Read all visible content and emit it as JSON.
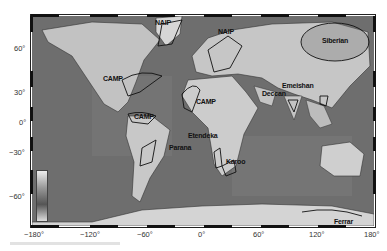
{
  "map": {
    "title": "World map of Large Igneous Provinces",
    "projection": "equirectangular",
    "x_axis": {
      "ticks": [
        "−180°",
        "−120°",
        "−60°",
        "0°",
        "60°",
        "120°",
        "180°"
      ]
    },
    "y_axis": {
      "ticks": [
        "60°",
        "30°",
        "0°",
        "−30°",
        "−60°"
      ]
    },
    "colors": {
      "ocean": "#6e6e6e",
      "land": "#c8c8c8",
      "outline": "#111111",
      "frame": "#222222"
    },
    "labels": [
      {
        "id": "naip-1",
        "text": "NAIP"
      },
      {
        "id": "naip-2",
        "text": "NAIP"
      },
      {
        "id": "siberian",
        "text": "Siberian"
      },
      {
        "id": "camp-na",
        "text": "CAMP"
      },
      {
        "id": "camp-af",
        "text": "CAMP"
      },
      {
        "id": "camp-sa",
        "text": "CAMP"
      },
      {
        "id": "emeishan",
        "text": "Emeishan"
      },
      {
        "id": "deccan",
        "text": "Deccan"
      },
      {
        "id": "etendeka",
        "text": "Etendeka"
      },
      {
        "id": "parana",
        "text": "Parana"
      },
      {
        "id": "karoo",
        "text": "Karoo"
      },
      {
        "id": "ferrar",
        "text": "Ferrar"
      }
    ]
  }
}
